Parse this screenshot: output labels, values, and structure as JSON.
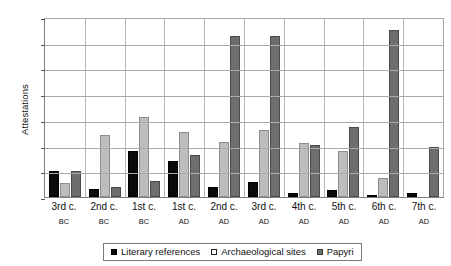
{
  "chart_data": {
    "type": "bar",
    "title": "",
    "xlabel": "",
    "ylabel": "Attestations",
    "ylim": [
      0,
      70
    ],
    "ytick_step": 10,
    "yticks": [
      70,
      60,
      50,
      40,
      30,
      20,
      10,
      0
    ],
    "grid": true,
    "legend_position": "bottom",
    "categories": [
      "3rd c.",
      "2nd c.",
      "1st c.",
      "1st c.",
      "2nd c.",
      "3rd c.",
      "4th c.",
      "5th c.",
      "6th c.",
      "7th c."
    ],
    "category_eras": [
      "BC",
      "BC",
      "BC",
      "AD",
      "AD",
      "AD",
      "AD",
      "AD",
      "AD",
      "AD"
    ],
    "series": [
      {
        "name": "Literary references",
        "color": "#0a0a0a",
        "values": [
          10,
          3,
          18,
          14,
          3.8,
          5.7,
          1.6,
          2.6,
          0.8,
          1.6
        ]
      },
      {
        "name": "Archaeological sites",
        "color": "#bdbdbd",
        "values": [
          5.5,
          24.2,
          31,
          25.4,
          21.4,
          26,
          20.9,
          18,
          7.3,
          0
        ]
      },
      {
        "name": "Papyri",
        "color": "#6e6e6e",
        "values": [
          10,
          3.9,
          6.1,
          16.4,
          62.6,
          62.6,
          20.3,
          27.3,
          64.8,
          19.4
        ]
      }
    ]
  }
}
